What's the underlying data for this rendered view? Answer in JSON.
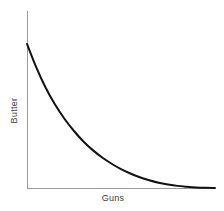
{
  "figure": {
    "width": 224,
    "height": 211,
    "background": "#ffffff"
  },
  "labels": {
    "ylabel": "Butter",
    "xlabel": "Guns",
    "label_color": "#3a3a3a"
  },
  "axes": {
    "line_color": "#9a9a9a",
    "line_width": 1,
    "origin_x": 27,
    "origin_y": 188,
    "y_axis_top": 11,
    "x_axis_right": 215
  },
  "curve": {
    "color": "#111111",
    "width": 2,
    "path": "M 27,44 C 40,92 52,124 72,146 C 92,168 118,180 148,185.5 C 168,188 192,188.2 215,188.3"
  },
  "chart_data": {
    "type": "line",
    "title": "",
    "xlabel": "Guns",
    "ylabel": "Butter",
    "legend": [],
    "grid": false,
    "xlim": [
      0,
      100
    ],
    "ylim": [
      0,
      100
    ],
    "xticks": [],
    "yticks": [],
    "series": [
      {
        "name": "Production possibility frontier",
        "x": [
          0,
          5,
          10,
          15,
          20,
          25,
          30,
          35,
          40,
          45,
          50,
          55,
          60,
          65,
          70,
          75,
          80,
          85,
          90,
          95,
          100
        ],
        "y": [
          81.4,
          68.0,
          56.5,
          47.0,
          39.0,
          32.2,
          26.3,
          21.4,
          17.2,
          13.7,
          10.7,
          8.2,
          6.1,
          4.4,
          3.0,
          2.0,
          1.2,
          0.7,
          0.3,
          0.1,
          0.0
        ]
      }
    ],
    "annotations": []
  }
}
